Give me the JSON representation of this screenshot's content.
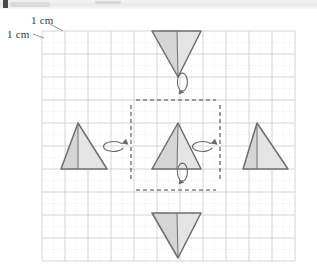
{
  "page": {
    "width": 317,
    "height": 274,
    "background": "#ffffff",
    "kind": "geometry-flip-diagram"
  },
  "topbar": {
    "present": true,
    "note": "cropped toolbar strip"
  },
  "labels": {
    "grid_unit_horizontal": "1 cm",
    "grid_unit_vertical": "1 cm"
  },
  "grid": {
    "origin_x": 42,
    "origin_y": 31,
    "cell_px": 23,
    "cols": 11,
    "rows": 10,
    "minor_divisions": 2,
    "major_color": "#cfcfcf",
    "minor_color": "#e6e6e6",
    "show_minor": true
  },
  "style": {
    "triangle_fill_left": "#d5d5d5",
    "triangle_fill_right": "#e4e4e4",
    "triangle_stroke": "#6e6e6e",
    "median_stroke": "#7a7a7a",
    "mirror_line_color": "#4a4a4a",
    "arrow_color": "#6a6a6a"
  },
  "shapes": [
    {
      "name": "triangle-top",
      "orientation": "down",
      "position": "top",
      "apex": [
        178,
        77
      ],
      "base_left": [
        152,
        31
      ],
      "base_right": [
        201,
        31
      ],
      "median_from": [
        177,
        31
      ],
      "role": "image-after-flip-over-horizontal-axis"
    },
    {
      "name": "triangle-center",
      "orientation": "up",
      "position": "center",
      "apex": [
        178,
        123
      ],
      "base_left": [
        152,
        169
      ],
      "base_right": [
        201,
        169
      ],
      "median_from": [
        177,
        169
      ],
      "role": "original-object"
    },
    {
      "name": "triangle-left",
      "orientation": "up",
      "position": "left",
      "apex": [
        78,
        123
      ],
      "base_left": [
        61,
        169
      ],
      "base_right": [
        107,
        169
      ],
      "median_from": [
        78,
        169
      ],
      "role": "image-after-flip-over-left-vertical-axis"
    },
    {
      "name": "triangle-right",
      "orientation": "up",
      "position": "right",
      "apex": [
        257,
        123
      ],
      "base_left": [
        243,
        169
      ],
      "base_right": [
        288,
        169
      ],
      "median_from": [
        257,
        169
      ],
      "role": "image-after-flip-over-right-vertical-axis"
    },
    {
      "name": "triangle-bottom",
      "orientation": "down",
      "position": "bottom",
      "apex": [
        178,
        258
      ],
      "base_left": [
        152,
        213
      ],
      "base_right": [
        201,
        213
      ],
      "median_from": [
        177,
        213
      ],
      "role": "image-after-flip-over-horizontal-axis"
    }
  ],
  "mirror_lines": [
    {
      "name": "mirror-line-top",
      "kind": "horizontal",
      "x1": 136,
      "y1": 100,
      "x2": 216,
      "y2": 100
    },
    {
      "name": "mirror-line-bottom",
      "kind": "horizontal",
      "x1": 136,
      "y1": 190,
      "x2": 216,
      "y2": 190
    },
    {
      "name": "mirror-line-left",
      "kind": "vertical",
      "x1": 131,
      "y1": 105,
      "x2": 131,
      "y2": 180
    },
    {
      "name": "mirror-line-right",
      "kind": "vertical",
      "x1": 220,
      "y1": 105,
      "x2": 220,
      "y2": 180
    }
  ],
  "flip_arrows": [
    {
      "name": "flip-arrow-top",
      "axis": "horizontal",
      "cx": 178,
      "cy": 98,
      "rx": 5,
      "ry": 9
    },
    {
      "name": "flip-arrow-bottom",
      "axis": "horizontal",
      "cx": 178,
      "cy": 188,
      "rx": 5,
      "ry": 9
    },
    {
      "name": "flip-arrow-left",
      "axis": "vertical",
      "cx": 131,
      "cy": 145,
      "rx": 10,
      "ry": 5
    },
    {
      "name": "flip-arrow-right",
      "axis": "vertical",
      "cx": 220,
      "cy": 145,
      "rx": 10,
      "ry": 5
    }
  ],
  "pointers": [
    {
      "name": "pointer-top-cm",
      "from": [
        50,
        24
      ],
      "to": [
        63,
        31
      ]
    },
    {
      "name": "pointer-left-cm",
      "from": [
        33,
        34
      ],
      "to": [
        44,
        38
      ]
    }
  ]
}
